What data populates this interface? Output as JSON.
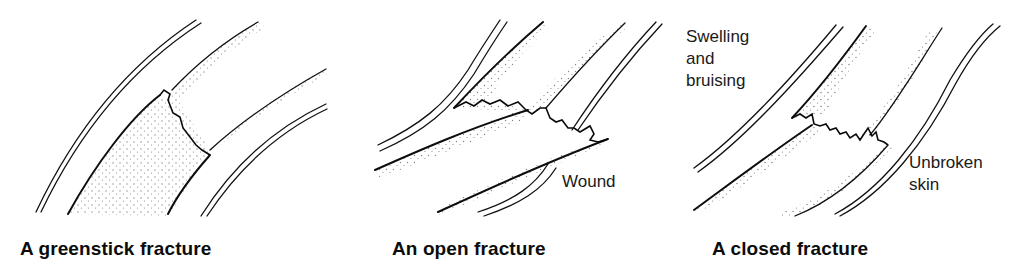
{
  "diagram": {
    "panels": [
      {
        "id": "greenstick",
        "caption": "A greenstick fracture",
        "annotations": []
      },
      {
        "id": "open",
        "caption": "An open fracture",
        "annotations": [
          {
            "label": "Wound"
          }
        ]
      },
      {
        "id": "closed",
        "caption": "A closed fracture",
        "annotations": [
          {
            "label": "Swelling\nand\nbruising"
          },
          {
            "label": "Unbroken\nskin"
          }
        ]
      }
    ],
    "colors": {
      "ink": "#111111",
      "background": "#ffffff"
    }
  }
}
